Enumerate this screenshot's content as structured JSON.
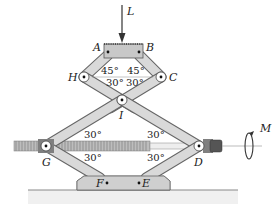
{
  "diagram": {
    "type": "scissor-jack",
    "load": {
      "label": "L",
      "direction": "down"
    },
    "moment": {
      "label": "M"
    },
    "points": {
      "A": "A",
      "B": "B",
      "C": "C",
      "D": "D",
      "E": "E",
      "F": "F",
      "G": "G",
      "H": "H",
      "I": "I"
    },
    "angles": {
      "top_left": "45°",
      "top_right": "45°",
      "mid_left": "30°",
      "mid_right": "30°",
      "G_upper": "30°",
      "G_lower": "30°",
      "D_upper": "30°",
      "D_lower": "30°"
    },
    "colors": {
      "link_fill": "#d9d9d9",
      "link_stroke": "#555555",
      "block_fill": "#c8c8c8",
      "base_fill": "#cfcfcf",
      "screw": "#8a8a8a",
      "ground": "#999999"
    }
  }
}
